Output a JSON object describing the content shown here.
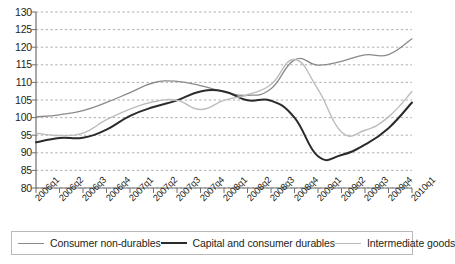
{
  "chart_data": {
    "type": "line",
    "title": "",
    "subtitle": "",
    "xlabel": "",
    "ylabel": "",
    "ylim": [
      80,
      130
    ],
    "ytick_step": 5,
    "yticks": [
      130,
      125,
      120,
      115,
      110,
      105,
      100,
      95,
      90,
      85,
      80
    ],
    "grid": true,
    "grid_style": "dashed-horizontal",
    "legend_position": "bottom",
    "categories": [
      "2006q1",
      "2006q2",
      "2006q3",
      "2006q4",
      "2007q1",
      "2007q2",
      "2007q3",
      "2007q4",
      "2008q1",
      "2008q2",
      "2008q3",
      "2008q4",
      "2009q1",
      "2009q2",
      "2009q3",
      "2009q4",
      "2010q1"
    ],
    "series": [
      {
        "name": "Consumer non-durables",
        "color": "#8a8a8a",
        "width": 1.3,
        "values": [
          100.2,
          100.8,
          102.0,
          104.3,
          107.1,
          109.9,
          110.3,
          109.1,
          107.3,
          106.3,
          108.2,
          116.4,
          114.9,
          116.0,
          117.8,
          117.9,
          122.4
        ]
      },
      {
        "name": "Capital and consumer durables",
        "color": "#2b2b2b",
        "width": 2.0,
        "values": [
          93.0,
          94.2,
          94.3,
          96.6,
          100.5,
          103.0,
          104.9,
          107.4,
          107.4,
          104.9,
          104.8,
          100.0,
          89.0,
          89.4,
          92.3,
          97.0,
          104.3
        ]
      },
      {
        "name": "Intermediate goods",
        "color": "#bcbcbc",
        "width": 1.4,
        "values": [
          95.6,
          94.9,
          95.6,
          99.4,
          102.4,
          104.5,
          104.9,
          102.3,
          104.9,
          106.5,
          109.4,
          116.5,
          108.0,
          95.9,
          96.4,
          100.2,
          107.4
        ]
      }
    ]
  },
  "legend": {
    "items": [
      {
        "label": "Consumer non-durables"
      },
      {
        "label": "Capital and consumer durables"
      },
      {
        "label": "Intermediate goods"
      }
    ]
  }
}
